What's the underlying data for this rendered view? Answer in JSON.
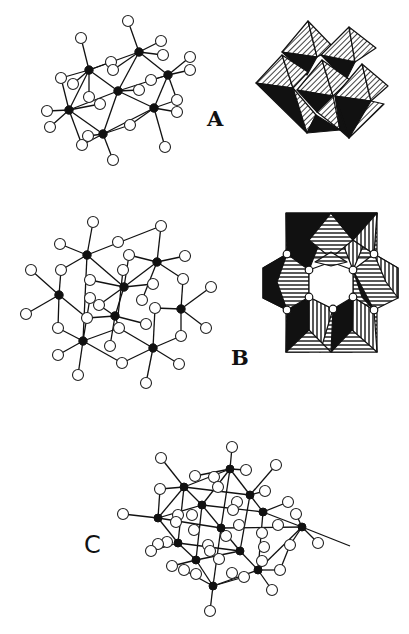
{
  "figure": {
    "panels": [
      {
        "id": "A",
        "label": "A",
        "description": "ball-and-stick cluster and polyhedral representation"
      },
      {
        "id": "B",
        "label": "B",
        "description": "ball-and-stick cluster and polyhedral ring representation"
      },
      {
        "id": "C",
        "label": "C",
        "description": "ball-and-stick spherical cluster"
      }
    ],
    "legend": {
      "metal_atom": "filled black circle",
      "oxygen_atom": "open white circle"
    },
    "colors": {
      "ink": "#111111",
      "background": "#ffffff"
    }
  }
}
